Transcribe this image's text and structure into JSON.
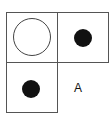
{
  "grid": {
    "cells": [
      {
        "row": 0,
        "col": 0,
        "content": "open-circle"
      },
      {
        "row": 0,
        "col": 1,
        "content": "filled-dot"
      },
      {
        "row": 1,
        "col": 0,
        "content": "filled-dot"
      },
      {
        "row": 1,
        "col": 1,
        "content": "label"
      }
    ],
    "missing_label": "A"
  },
  "colors": {
    "line": "#555555",
    "dot": "#111111"
  }
}
